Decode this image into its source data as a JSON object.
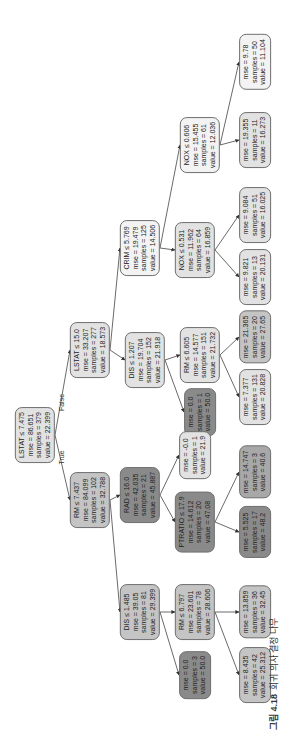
{
  "figure": {
    "caption_label": "그림 4.18",
    "caption_text": "회귀 의사 결정 나무"
  },
  "edge_labels": {
    "true": "True",
    "false": "False"
  },
  "colors": {
    "light": "#f3f3f3",
    "light_mid": "#e2e2e2",
    "mid": "#c4c4c4",
    "mid_dark": "#a8a8a8",
    "dark": "#8a8a8a",
    "border": "#6e6e6e",
    "edge": "#444444"
  },
  "nodes": [
    {
      "id": "n0",
      "sx": 35,
      "sy": 435,
      "tone": "light_mid",
      "lines": [
        "LSTAT ≤ 7.475",
        "mse = 86.651",
        "samples = 379",
        "value = 22.399"
      ]
    },
    {
      "id": "n1",
      "sx": 90,
      "sy": 350,
      "tone": "light_mid",
      "lines": [
        "LSTAT ≤ 15.0",
        "mse = 33.207",
        "samples = 277",
        "value = 18.573"
      ]
    },
    {
      "id": "n2",
      "sx": 90,
      "sy": 500,
      "tone": "mid",
      "lines": [
        "RM ≤ 7.437",
        "mse = 84.099",
        "samples = 102",
        "value = 32.788"
      ]
    },
    {
      "id": "n3",
      "sx": 140,
      "sy": 248,
      "tone": "light",
      "lines": [
        "CRIM ≤ 5.769",
        "mse = 19.479",
        "samples = 125",
        "value = 14.506"
      ]
    },
    {
      "id": "n4",
      "sx": 145,
      "sy": 360,
      "tone": "light_mid",
      "lines": [
        "DIS ≤ 1.207",
        "mse = 19.704",
        "samples = 152",
        "value = 21.918"
      ]
    },
    {
      "id": "n5",
      "sx": 140,
      "sy": 495,
      "tone": "dark",
      "lines": [
        "RAD ≤ 16.0",
        "mse = 42.035",
        "samples = 21",
        "value = 45.887"
      ]
    },
    {
      "id": "n6",
      "sx": 140,
      "sy": 612,
      "tone": "mid",
      "lines": [
        "DIS ≤ 1.485",
        "mse = 39.05",
        "samples = 81",
        "value = 29.399"
      ]
    },
    {
      "id": "n7",
      "sx": 200,
      "sy": 145,
      "tone": "light",
      "lines": [
        "NOX ≤ 0.606",
        "mse = 15.455",
        "samples = 61",
        "value = 12.036"
      ]
    },
    {
      "id": "n8",
      "sx": 195,
      "sy": 250,
      "tone": "light_mid",
      "lines": [
        "NOX ≤ 0.531",
        "mse = 11.962",
        "samples = 64",
        "value = 16.859"
      ]
    },
    {
      "id": "n9",
      "sx": 200,
      "sy": 355,
      "tone": "light_mid",
      "lines": [
        "RM ≤ 6.605",
        "mse = 14.577",
        "samples = 151",
        "value = 21.732"
      ]
    },
    {
      "id": "n10",
      "sx": 200,
      "sy": 412,
      "tone": "dark",
      "lines": [
        "mse = 0.0",
        "samples = 1",
        "value = 50.0"
      ]
    },
    {
      "id": "n11",
      "sx": 195,
      "sy": 455,
      "tone": "light_mid",
      "lines": [
        "mse = -0.0",
        "samples = 1",
        "value = 21.9"
      ]
    },
    {
      "id": "n12",
      "sx": 195,
      "sy": 522,
      "tone": "dark",
      "lines": [
        "PTRATIO ≤ 17.9",
        "mse = 14.612",
        "samples = 20",
        "value = 47.08"
      ]
    },
    {
      "id": "n13",
      "sx": 195,
      "sy": 612,
      "tone": "mid",
      "lines": [
        "RM ≤ 6.797",
        "mse = 23.601",
        "samples = 78",
        "value = 28.606"
      ]
    },
    {
      "id": "n14",
      "sx": 195,
      "sy": 675,
      "tone": "dark",
      "lines": [
        "mse = 0.0",
        "samples = 3",
        "value = 50.0"
      ]
    },
    {
      "id": "n15",
      "sx": 255,
      "sy": 62,
      "tone": "light",
      "lines": [
        "mse = 9.78",
        "samples = 50",
        "value = 11.104"
      ]
    },
    {
      "id": "n16",
      "sx": 255,
      "sy": 140,
      "tone": "light_mid",
      "lines": [
        "mse = 19.355",
        "samples = 11",
        "value = 16.273"
      ]
    },
    {
      "id": "n17",
      "sx": 255,
      "sy": 215,
      "tone": "light_mid",
      "lines": [
        "mse = 9.084",
        "samples = 51",
        "value = 16.025"
      ]
    },
    {
      "id": "n18",
      "sx": 255,
      "sy": 277,
      "tone": "light_mid",
      "lines": [
        "mse = 9.821",
        "samples = 13",
        "value = 20.131"
      ]
    },
    {
      "id": "n19",
      "sx": 255,
      "sy": 337,
      "tone": "mid",
      "lines": [
        "mse = 21.365",
        "samples = 20",
        "value = 27.65"
      ]
    },
    {
      "id": "n20",
      "sx": 255,
      "sy": 397,
      "tone": "light_mid",
      "lines": [
        "mse = 7.377",
        "samples = 131",
        "value = 20.828"
      ]
    },
    {
      "id": "n21",
      "sx": 255,
      "sy": 472,
      "tone": "mid_dark",
      "lines": [
        "mse = 14.747",
        "samples = 3",
        "value = 40.6"
      ]
    },
    {
      "id": "n22",
      "sx": 255,
      "sy": 532,
      "tone": "dark",
      "lines": [
        "mse = 5.525",
        "samples = 17",
        "value = 48.2"
      ]
    },
    {
      "id": "n23",
      "sx": 255,
      "sy": 612,
      "tone": "mid",
      "lines": [
        "mse = 13.859",
        "samples = 36",
        "value = 32.45"
      ]
    },
    {
      "id": "n24",
      "sx": 255,
      "sy": 675,
      "tone": "mid",
      "lines": [
        "mse = 8.435",
        "samples = 42",
        "value = 25.312"
      ]
    }
  ],
  "edges": [
    [
      "n0",
      "n2",
      "true"
    ],
    [
      "n0",
      "n1",
      "false"
    ],
    [
      "n1",
      "n4"
    ],
    [
      "n1",
      "n3"
    ],
    [
      "n2",
      "n6"
    ],
    [
      "n2",
      "n5"
    ],
    [
      "n3",
      "n8"
    ],
    [
      "n3",
      "n7"
    ],
    [
      "n4",
      "n10"
    ],
    [
      "n4",
      "n9"
    ],
    [
      "n5",
      "n12"
    ],
    [
      "n5",
      "n11"
    ],
    [
      "n6",
      "n14"
    ],
    [
      "n6",
      "n13"
    ],
    [
      "n7",
      "n16"
    ],
    [
      "n7",
      "n15"
    ],
    [
      "n8",
      "n18"
    ],
    [
      "n8",
      "n17"
    ],
    [
      "n9",
      "n20"
    ],
    [
      "n9",
      "n19"
    ],
    [
      "n12",
      "n22"
    ],
    [
      "n12",
      "n21"
    ],
    [
      "n13",
      "n24"
    ],
    [
      "n13",
      "n23"
    ]
  ]
}
